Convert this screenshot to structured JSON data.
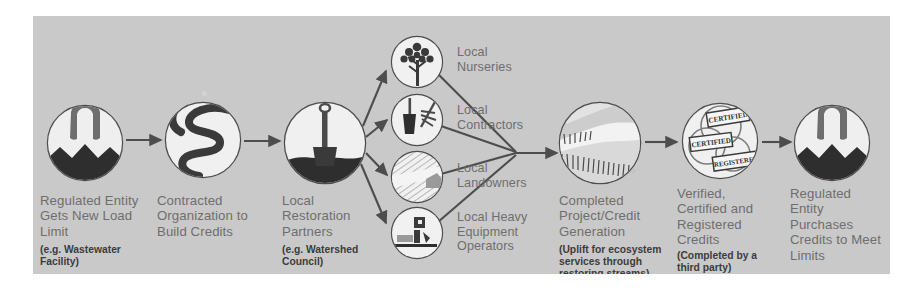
{
  "diagram": {
    "background_color": "#c9c9c9",
    "label_color": "#6e6e6e",
    "sublabel_color": "#3c3c3c",
    "stroke_color": "#4d4d4d",
    "circle_fill": "#e8e8e8"
  },
  "nodes": [
    {
      "id": "regulated-entity-load-limit",
      "label": "Regulated Entity\nGets New Load\nLimit",
      "sublabel": "(e.g. Wastewater\nFacility)",
      "icon": "wastewater-facility-icon"
    },
    {
      "id": "contracted-organization",
      "label": "Contracted\nOrganization to\nBuild Credits",
      "sublabel": "",
      "icon": "winding-stream-icon"
    },
    {
      "id": "local-restoration-partners",
      "label": "Local\nRestoration\nPartners",
      "sublabel": "(e.g. Watershed\nCouncil)",
      "icon": "shovel-in-soil-icon"
    },
    {
      "id": "completed-project-credit-generation",
      "label": "Completed\nProject/Credit\nGeneration",
      "sublabel": "(Uplift for ecosystem\nservices through\nrestoring streams)",
      "icon": "restored-stream-icon"
    },
    {
      "id": "verified-certified-registered-credits",
      "label": "Verified,\nCertified and\nRegistered\nCredits",
      "sublabel": "(Completed by a\nthird party)",
      "icon": "certification-stamps-icon"
    },
    {
      "id": "regulated-entity-purchases-credits",
      "label": "Regulated\nEntity\nPurchases\nCredits to Meet\nLimits",
      "sublabel": "",
      "icon": "wastewater-facility-icon"
    }
  ],
  "branches": [
    {
      "id": "local-nurseries",
      "label": "Local\nNurseries",
      "icon": "tree-sapling-icon"
    },
    {
      "id": "local-contractors",
      "label": "Local\nContractors",
      "icon": "hand-tools-icon"
    },
    {
      "id": "local-landowners",
      "label": "Local\nLandowners",
      "icon": "farm-field-icon"
    },
    {
      "id": "local-heavy-equipment-operators",
      "label": "Local Heavy\nEquipment\nOperators",
      "icon": "excavator-truck-icon"
    }
  ],
  "stamps": {
    "top": "CERTIFIED",
    "middle": "CERTIFIED",
    "bottom": "REGISTERED"
  }
}
